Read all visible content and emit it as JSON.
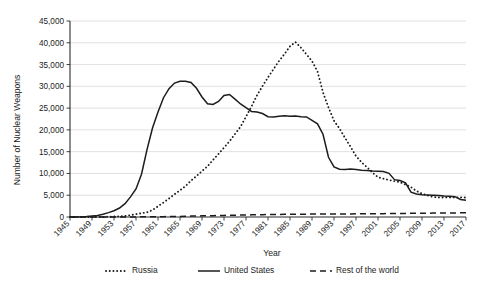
{
  "chart_data": {
    "type": "line",
    "title": "",
    "xlabel": "Year",
    "ylabel": "Number of Nuclear Weapons",
    "xlim": [
      1945,
      2017
    ],
    "ylim": [
      0,
      45000
    ],
    "grid": "horizontal",
    "legend_position": "bottom",
    "ytick_labels": [
      "0",
      "5,000",
      "10,000",
      "15,000",
      "20,000",
      "25,000",
      "30,000",
      "35,000",
      "40,000",
      "45,000"
    ],
    "ytick_values": [
      0,
      5000,
      10000,
      15000,
      20000,
      25000,
      30000,
      35000,
      40000,
      45000
    ],
    "xtick_labels": [
      "1945",
      "1949",
      "1953",
      "1957",
      "1961",
      "1965",
      "1969",
      "1973",
      "1977",
      "1981",
      "1985",
      "1989",
      "1993",
      "1997",
      "2001",
      "2005",
      "2009",
      "2013",
      "2017"
    ],
    "xtick_values": [
      1945,
      1949,
      1953,
      1957,
      1961,
      1965,
      1969,
      1973,
      1977,
      1981,
      1985,
      1989,
      1993,
      1997,
      2001,
      2005,
      2009,
      2013,
      2017
    ],
    "x": [
      1945,
      1946,
      1947,
      1948,
      1949,
      1950,
      1951,
      1952,
      1953,
      1954,
      1955,
      1956,
      1957,
      1958,
      1959,
      1960,
      1961,
      1962,
      1963,
      1964,
      1965,
      1966,
      1967,
      1968,
      1969,
      1970,
      1971,
      1972,
      1973,
      1974,
      1975,
      1976,
      1977,
      1978,
      1979,
      1980,
      1981,
      1982,
      1983,
      1984,
      1985,
      1986,
      1987,
      1988,
      1989,
      1990,
      1991,
      1992,
      1993,
      1994,
      1995,
      1996,
      1997,
      1998,
      1999,
      2000,
      2001,
      2002,
      2003,
      2004,
      2005,
      2006,
      2007,
      2008,
      2009,
      2010,
      2011,
      2012,
      2013,
      2014,
      2015,
      2016,
      2017
    ],
    "series": [
      {
        "name": "Russia",
        "style": "dotted",
        "color": "#1c1c1c",
        "values": [
          0,
          0,
          0,
          0,
          1,
          5,
          25,
          50,
          120,
          150,
          200,
          426,
          660,
          869,
          1060,
          1605,
          2471,
          3322,
          4238,
          5221,
          6129,
          7089,
          8339,
          9399,
          10538,
          11643,
          13092,
          14478,
          15915,
          17385,
          19055,
          20723,
          23044,
          25393,
          27935,
          30062,
          32049,
          33952,
          35804,
          37431,
          39197,
          40159,
          38859,
          37333,
          35805,
          33417,
          28595,
          25155,
          22101,
          20314,
          18179,
          16149,
          14010,
          12576,
          11423,
          10201,
          9126,
          8796,
          8484,
          8232,
          7992,
          7440,
          6852,
          5970,
          5360,
          4950,
          4620,
          4500,
          4490,
          4500,
          4500,
          4500,
          4480
        ]
      },
      {
        "name": "United States",
        "style": "solid",
        "color": "#1c1c1c",
        "values": [
          6,
          11,
          32,
          110,
          235,
          369,
          640,
          1005,
          1436,
          2063,
          3057,
          4618,
          6444,
          9822,
          15468,
          20434,
          24111,
          27387,
          29459,
          30751,
          31139,
          31175,
          30893,
          29561,
          27552,
          26008,
          25830,
          26516,
          27912,
          28138,
          27052,
          25956,
          25099,
          24243,
          24107,
          23764,
          23031,
          22937,
          23154,
          23228,
          23135,
          23193,
          23038,
          22975,
          22174,
          21392,
          19008,
          13708,
          11511,
          10979,
          10904,
          11011,
          10903,
          10732,
          10685,
          10577,
          10526,
          10457,
          10027,
          8570,
          8360,
          7853,
          5709,
          5273,
          5113,
          5066,
          5000,
          4950,
          4804,
          4760,
          4670,
          4018,
          3822
        ]
      },
      {
        "name": "Rest of the world",
        "style": "dashed",
        "color": "#1c1c1c",
        "values": [
          0,
          0,
          0,
          0,
          0,
          0,
          0,
          1,
          1,
          5,
          10,
          15,
          21,
          32,
          41,
          52,
          65,
          80,
          96,
          117,
          141,
          170,
          203,
          233,
          260,
          287,
          315,
          342,
          365,
          390,
          415,
          442,
          466,
          490,
          512,
          534,
          555,
          572,
          588,
          604,
          618,
          632,
          646,
          660,
          672,
          680,
          690,
          694,
          698,
          700,
          706,
          712,
          718,
          726,
          736,
          748,
          760,
          772,
          786,
          800,
          816,
          830,
          846,
          860,
          872,
          884,
          896,
          908,
          920,
          932,
          940,
          948,
          955
        ]
      }
    ]
  },
  "legend": {
    "items": [
      {
        "label": "Russia"
      },
      {
        "label": "United States"
      },
      {
        "label": "Rest of the world"
      }
    ]
  }
}
